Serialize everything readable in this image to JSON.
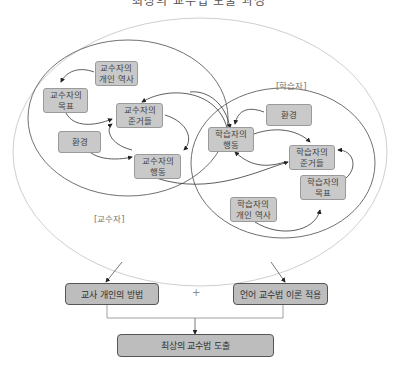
{
  "title": "최상의 교수법 도출 과정",
  "teacher_circle": {
    "label": "[교수자]",
    "nodes": {
      "personal_history": "교수자의\n개인 역사",
      "goal": "교수자의\n목표",
      "norms": "교수자의\n준거들",
      "environment": "환경",
      "behavior": "교수자의\n행동"
    }
  },
  "learner_circle": {
    "label": "[학습자]",
    "nodes": {
      "environment": "환경",
      "behavior": "학습자의\n행동",
      "norms": "학습자의\n준거들",
      "goal": "학습자의\n목표",
      "personal_history": "학습자의\n개인 역사"
    }
  },
  "bottom": {
    "left_box": "교사 개인의 방법",
    "plus": "+",
    "right_box": "언어 교수법 이론 적용",
    "result_box": "최상의 교수법 도출"
  },
  "colors": {
    "node_fill": "#c9c9c9",
    "outer_ellipse": "#c8c8c8",
    "circle_stroke": "#6e6e6e",
    "arrow": "#333333"
  }
}
